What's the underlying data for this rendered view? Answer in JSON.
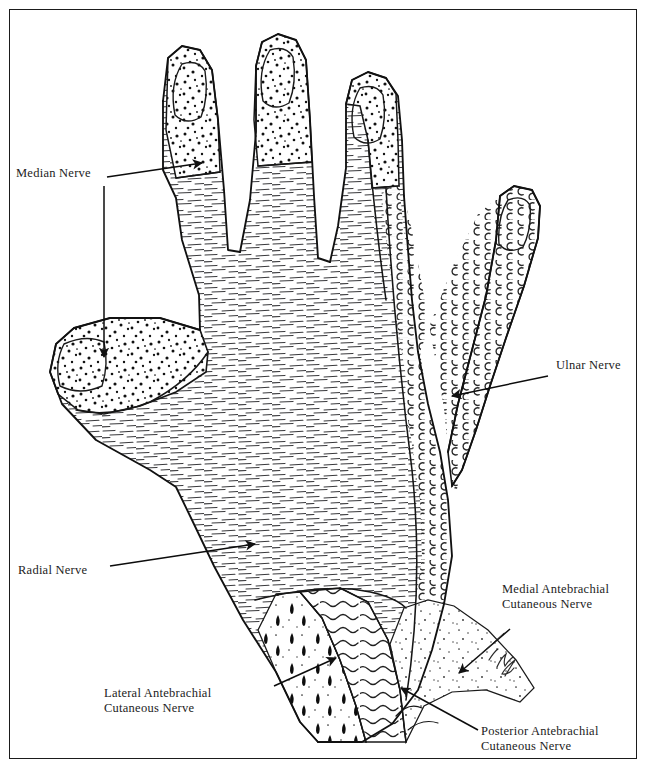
{
  "figure": {
    "border_color": "#1b1b1b",
    "background_color": "#ffffff",
    "ink_color": "#1c1c1c"
  },
  "labels": {
    "median": "Median Nerve",
    "ulnar": "Ulnar Nerve",
    "radial": "Radial Nerve",
    "medial_antebrachial": "Medial Antebrachial\nCutaneous Nerve",
    "lateral_antebrachial": "Lateral Antebrachial\nCutaneous Nerve",
    "posterior_antebrachial": "Posterior Antebrachial\nCutaneous Nerve"
  },
  "signature": {
    "text": "Kim",
    "note": "handwritten artist signature near forearm"
  },
  "regions": [
    {
      "name": "Median Nerve",
      "pattern": "coarse stipple dots",
      "areas": "dorsal tips of thumb, index, middle and radial half of ring finger"
    },
    {
      "name": "Ulnar Nerve",
      "pattern": "small crescent / c-shaped marks",
      "areas": "little finger, ulnar half of ring finger, ulnar border of dorsum"
    },
    {
      "name": "Radial Nerve",
      "pattern": "short horizontal dashes",
      "areas": "dorsum of hand, thumb web, proximal phalanges"
    },
    {
      "name": "Medial Antebrachial Cutaneous Nerve",
      "pattern": "fine sparse stipple",
      "areas": "medial distal forearm"
    },
    {
      "name": "Lateral Antebrachial Cutaneous Nerve",
      "pattern": "teardrop / elongated dashes",
      "areas": "lateral distal forearm"
    },
    {
      "name": "Posterior Antebrachial Cutaneous Nerve",
      "pattern": "wavy horizontal lines",
      "areas": "posterior distal forearm"
    }
  ]
}
